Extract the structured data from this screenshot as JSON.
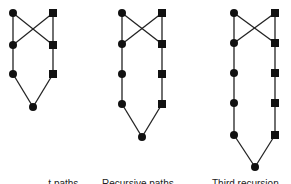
{
  "figure": {
    "graphs": [
      {
        "id": "graph-1",
        "left_x": 13,
        "right_x": 53,
        "rows_y": [
          13,
          45,
          74
        ],
        "bottom": {
          "x": 33,
          "y": 107
        }
      },
      {
        "id": "graph-2",
        "left_x": 122,
        "right_x": 162,
        "rows_y": [
          13,
          44,
          74,
          104
        ],
        "bottom": {
          "x": 142,
          "y": 137
        }
      },
      {
        "id": "graph-3",
        "left_x": 234,
        "right_x": 275,
        "rows_y": [
          13,
          43,
          73,
          103,
          135
        ],
        "bottom": {
          "x": 255,
          "y": 167
        }
      }
    ],
    "node_color": "#111111",
    "edge_color": "#222222",
    "captions": [
      {
        "label": "...t paths",
        "x": 40
      },
      {
        "label": "Recursive paths",
        "x": 102
      },
      {
        "label": "Third recursion",
        "x": 212
      }
    ]
  }
}
